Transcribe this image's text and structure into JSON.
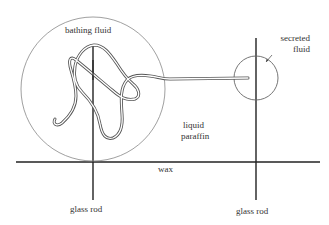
{
  "diagram": {
    "type": "apparatus-schematic",
    "labels": {
      "bathing_fluid": "bathing fluid",
      "secreted_fluid_line1": "secreted",
      "secreted_fluid_line2": "fluid",
      "liquid_paraffin_line1": "liquid",
      "liquid_paraffin_line2": "paraffin",
      "wax": "wax",
      "glass_rod_left": "glass rod",
      "glass_rod_right": "glass rod"
    },
    "colors": {
      "line": "#222222",
      "circle": "#777777",
      "tubule": "#666666",
      "text": "#333333",
      "background": "#ffffff"
    }
  }
}
